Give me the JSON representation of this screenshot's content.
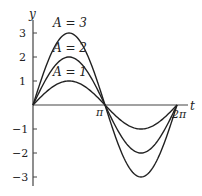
{
  "chart_data": {
    "type": "line",
    "title": "",
    "xlabel": "t",
    "ylabel": "y",
    "xlim": [
      0,
      6.2832
    ],
    "ylim": [
      -3,
      3
    ],
    "x_ticks": [
      "π",
      "2π"
    ],
    "y_ticks": [
      "3",
      "2",
      "1",
      "−1",
      "−2",
      "−3"
    ],
    "grid": false,
    "legend": "inline annotations",
    "function": "y = A sin t",
    "series": [
      {
        "name": "A = 3",
        "amplitude": 3
      },
      {
        "name": "A = 2",
        "amplitude": 2
      },
      {
        "name": "A = 1",
        "amplitude": 1
      }
    ]
  },
  "axes": {
    "x_label": "t",
    "y_label": "y",
    "pi_label": "π",
    "two_pi_label": "2π"
  },
  "annotations": {
    "a3": "A = 3",
    "a2": "A = 2",
    "a1": "A = 1"
  },
  "y_tick_labels": {
    "p3": "3",
    "p2": "2",
    "p1": "1",
    "m1": "−1",
    "m2": "−2",
    "m3": "−3"
  },
  "colors": {
    "curve": "#222222",
    "axis": "#444444"
  }
}
